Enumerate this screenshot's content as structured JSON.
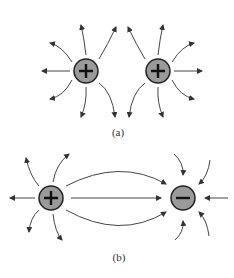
{
  "figure": {
    "panel_a": {
      "caption": "(a)",
      "description": "Field lines of two positive charges",
      "charges": [
        {
          "sign": "+",
          "label": "positive-charge",
          "x": 86,
          "y": 71
        },
        {
          "sign": "+",
          "label": "positive-charge",
          "x": 158,
          "y": 71
        }
      ]
    },
    "panel_b": {
      "caption": "(b)",
      "description": "Field lines from a positive charge to a negative charge",
      "charges": [
        {
          "sign": "+",
          "label": "positive-charge",
          "x": 51,
          "y": 198
        },
        {
          "sign": "−",
          "label": "negative-charge",
          "x": 183,
          "y": 198
        }
      ]
    },
    "colors": {
      "charge_fill": "#9a9a9a",
      "line": "#333333"
    }
  }
}
